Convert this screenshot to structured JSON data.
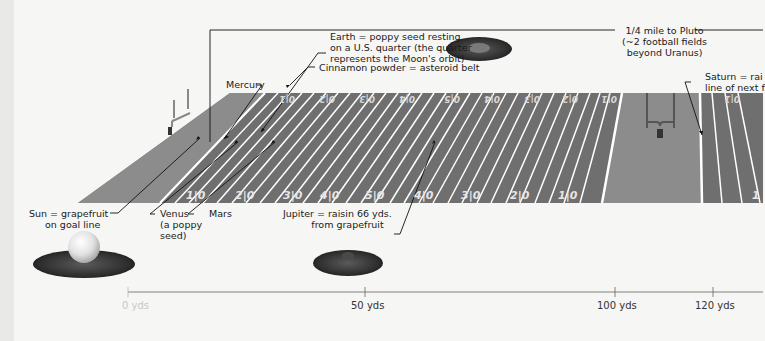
{
  "colors": {
    "background": "#f6f6f4",
    "field": "#6f6f6f",
    "end_zone": "#8c8c8c",
    "yard_line": "#ffffff",
    "label_text": "#1a1a1a",
    "leader_line": "#111111"
  },
  "field": {
    "yard_numbers_near": [
      "1|0",
      "2|0",
      "3|0",
      "4|0",
      "5|0",
      "4|0",
      "3|0",
      "2|0",
      "1|0"
    ],
    "yard_numbers_far": [
      "10",
      "20",
      "30",
      "40",
      "50",
      "40",
      "30",
      "20",
      "10"
    ],
    "next_field_number_near": "1",
    "next_field_number_far": "10"
  },
  "labels": {
    "mercury": "Mercury",
    "earth_line1": "Earth = poppy seed resting",
    "earth_line2": "on a U.S. quarter (the quarter",
    "earth_line3": "represents the Moon's orbit)",
    "asteroid_belt": "Cinnamon powder = asteroid belt",
    "pluto_line1": "1/4 mile to Pluto",
    "pluto_line2": "(~2 football fields",
    "pluto_line3": "beyond Uranus)",
    "saturn_line1": "Saturn = rai",
    "saturn_line2": "line of next f",
    "sun_line1": "Sun = grapefruit",
    "sun_line2": "on goal line",
    "venus_line1": "Venus",
    "venus_line2": "(a poppy",
    "venus_line3": "seed)",
    "mars": "Mars",
    "jupiter_line1": "Jupiter = raisin 66 yds.",
    "jupiter_line2": "from grapefruit"
  },
  "icons": {
    "sun": "grapefruit-on-grass-icon",
    "jupiter": "raisin-on-grass-icon",
    "earth": "quarter-on-grass-icon",
    "goalposts": "goalpost-icon"
  },
  "axis": {
    "ticks": [
      {
        "label": "0 yds",
        "value": 0
      },
      {
        "label": "50 yds",
        "value": 50
      },
      {
        "label": "100 yds",
        "value": 100
      },
      {
        "label": "120 yds",
        "value": 120
      }
    ]
  }
}
